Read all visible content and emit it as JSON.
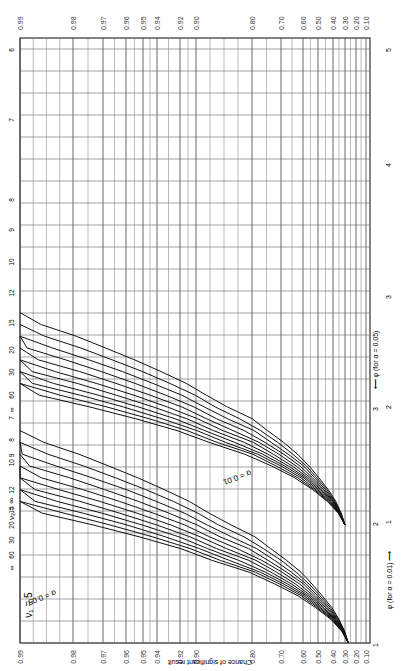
{
  "chart_data": {
    "type": "line",
    "subtitle": "ν1 = 5",
    "orientation": "rotated 90° clockwise",
    "xlabel": "φ",
    "xlabel_alpha_001": "φ (for α = 0.01) ⟶",
    "xlabel_alpha_005": "⟵ φ (for α = 0.05)",
    "ylabel": "Chance of significant result",
    "y_ticks": [
      "0.99",
      "0.98",
      "0.97",
      "0.96",
      "0.95",
      "0.94",
      "0.92",
      "0.90",
      "0.80",
      "0.70",
      "0.60",
      "0.50",
      "0.40",
      "0.30",
      "0.20",
      "0.10"
    ],
    "y_tick_values": [
      0.99,
      0.98,
      0.97,
      0.96,
      0.95,
      0.94,
      0.92,
      0.9,
      0.8,
      0.7,
      0.6,
      0.5,
      0.4,
      0.3,
      0.2,
      0.1
    ],
    "y_tick_px": [
      20,
      73,
      103,
      126,
      143,
      157,
      180,
      196,
      252,
      281,
      303,
      318,
      333,
      345,
      356,
      366
    ],
    "x_ticks_alpha_001": [
      "1",
      "2",
      "3"
    ],
    "x_ticks_alpha_001_px": [
      643,
      522,
      407
    ],
    "x_ticks_alpha_005": [
      "1",
      "2",
      "3",
      "4",
      "5"
    ],
    "x_ticks_alpha_005_px": [
      643,
      522,
      407,
      297,
      170
    ],
    "x_ticks_alpha_005_label_px": [
      522,
      407,
      297,
      165,
      50
    ],
    "nu2_label": "ν2 =",
    "nu2_values": [
      "∞",
      "60",
      "30",
      "20",
      "15",
      "12",
      "10",
      "9",
      "8",
      "7",
      "6"
    ],
    "alpha_labels": [
      "α = 0.05",
      "α = 0.01"
    ],
    "grid": true,
    "series": [
      {
        "group": "α=0.01",
        "name": "ν2=6",
        "phi": [
          2.0,
          2.4,
          3.0,
          3.5,
          4.0,
          4.6
        ],
        "power": [
          0.25,
          0.45,
          0.7,
          0.84,
          0.93,
          0.975
        ]
      },
      {
        "group": "α=0.01",
        "name": "ν2=∞",
        "phi": [
          2.0,
          2.3,
          2.7,
          3.0,
          3.5
        ],
        "power": [
          0.35,
          0.6,
          0.85,
          0.93,
          0.98
        ]
      },
      {
        "group": "α=0.05",
        "name": "ν2=6",
        "phi": [
          1.0,
          1.5,
          2.0,
          2.5,
          3.0,
          3.5,
          4.0,
          4.6
        ],
        "power": [
          0.3,
          0.5,
          0.68,
          0.82,
          0.9,
          0.95,
          0.975,
          0.99
        ]
      },
      {
        "group": "α=0.05",
        "name": "ν2=∞",
        "phi": [
          1.0,
          1.5,
          2.0,
          2.5,
          3.0
        ],
        "power": [
          0.38,
          0.68,
          0.9,
          0.97,
          0.99
        ]
      }
    ]
  },
  "labels": {
    "nu1": "ν₁ = 5",
    "nu2_prefix": "ν₂ = ∞",
    "alpha_005": "α = 0.05",
    "alpha_001": "α = 0.01",
    "phi_001": "φ (for α = 0.01) ⟶",
    "phi_005": "⟵ φ (for α = 0.05)",
    "ylabel": "Chance of significant result"
  }
}
